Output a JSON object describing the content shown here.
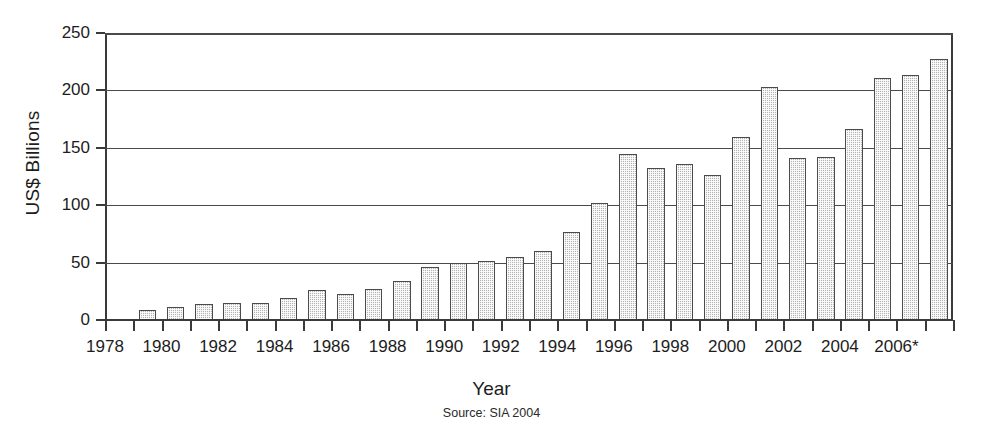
{
  "chart_data": {
    "type": "bar",
    "title": "",
    "xlabel": "Year",
    "ylabel": "US$ Billions",
    "source": "Source: SIA 2004",
    "ylim": [
      0,
      250
    ],
    "yticks": [
      0,
      50,
      100,
      150,
      200,
      250
    ],
    "ytick_labels": [
      "0",
      "50",
      "100",
      "150",
      "200",
      "250"
    ],
    "grid": true,
    "legend": null,
    "xtick_labels": [
      "1978",
      "1980",
      "1982",
      "1984",
      "1986",
      "1988",
      "1990",
      "1992",
      "1994",
      "1996",
      "1998",
      "2000",
      "2002",
      "2004",
      "2006*"
    ],
    "categories": [
      "1979",
      "1980",
      "1981",
      "1982",
      "1983",
      "1984",
      "1985",
      "1986",
      "1987",
      "1988",
      "1989",
      "1990",
      "1991",
      "1992",
      "1993",
      "1994",
      "1995",
      "1996",
      "1997",
      "1998",
      "1999",
      "2000",
      "2001",
      "2002",
      "2003",
      "2004",
      "2005",
      "2006"
    ],
    "values": [
      9,
      11,
      14,
      15,
      15,
      19,
      26,
      23,
      27,
      34,
      46,
      50,
      51,
      55,
      60,
      77,
      102,
      145,
      132,
      136,
      126,
      159,
      203,
      141,
      142,
      166,
      211,
      213
    ],
    "bar_color": "#b4b4b4",
    "bar_edge_color": "#4b4b4b",
    "note": "2006 value 227 projected",
    "values_full": [
      9,
      11,
      14,
      15,
      15,
      19,
      26,
      23,
      27,
      34,
      46,
      50,
      51,
      55,
      60,
      77,
      102,
      145,
      132,
      136,
      126,
      159,
      203,
      141,
      142,
      166,
      211,
      213,
      227
    ]
  }
}
